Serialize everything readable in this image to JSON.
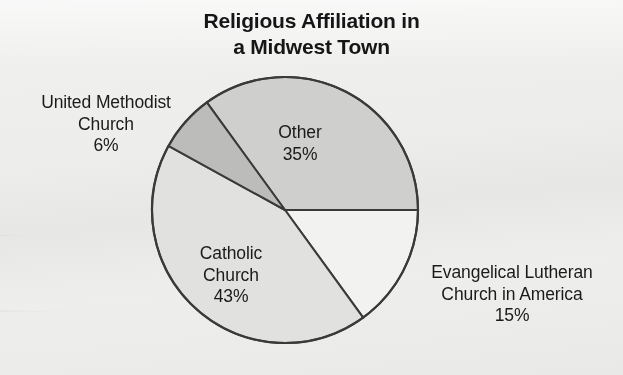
{
  "chart_data": {
    "type": "pie",
    "title": "Religious Affiliation in\na Midwest Town",
    "title_line1": "Religious Affiliation in",
    "title_line2": "a Midwest Town",
    "categories": [
      "Other",
      "Evangelical Lutheran Church in America",
      "Catholic Church",
      "United Methodist Church"
    ],
    "values": [
      35,
      15,
      43,
      6
    ],
    "value_labels": [
      "35%",
      "15%",
      "43%",
      "6%"
    ],
    "unit": "%",
    "legend": "none",
    "grid": false,
    "start_angle_deg": 0,
    "direction": "clockwise",
    "slices": [
      {
        "name": "Other",
        "value": 35,
        "value_label": "35%",
        "label_line1": "Other",
        "label_line2": "35%",
        "label_text": "Other\n35%",
        "label_placement": "inside",
        "color": "#cfcfcd",
        "start_deg": 234.0,
        "end_deg": 360.0
      },
      {
        "name": "Evangelical Lutheran Church in America",
        "value": 15,
        "value_label": "15%",
        "label_line1": "Evangelical Lutheran",
        "label_line2": "Church in America",
        "label_line3": "15%",
        "label_text": "Evangelical Lutheran\nChurch in America\n15%",
        "label_placement": "outside-right",
        "color": "#f2f2f1",
        "start_deg": 0.0,
        "end_deg": 54.0
      },
      {
        "name": "Catholic Church",
        "value": 43,
        "value_label": "43%",
        "label_line1": "Catholic",
        "label_line2": "Church",
        "label_line3": "43%",
        "label_text": "Catholic\nChurch\n43%",
        "label_placement": "inside",
        "color": "#e1e1df",
        "start_deg": 54.0,
        "end_deg": 208.8
      },
      {
        "name": "United Methodist Church",
        "value": 6,
        "value_label": "6%",
        "label_line1": "United Methodist",
        "label_line2": "Church",
        "label_line3": "6%",
        "label_text": "United Methodist\nChurch\n6%",
        "label_placement": "outside-left",
        "color": "#bcbcba",
        "start_deg": 208.8,
        "end_deg": 234.0
      }
    ],
    "geometry": {
      "center_x": 285,
      "center_y": 210,
      "radius": 133
    },
    "colors": {
      "background": "#ececeb",
      "outline": "#3a3a3a",
      "text": "#1b1b1b",
      "title": "#161616"
    }
  },
  "labels": {
    "other": "Other\n35%",
    "evangelical": "Evangelical Lutheran\nChurch in America\n15%",
    "catholic": "Catholic\nChurch\n43%",
    "united_methodist": "United Methodist\nChurch\n6%"
  }
}
